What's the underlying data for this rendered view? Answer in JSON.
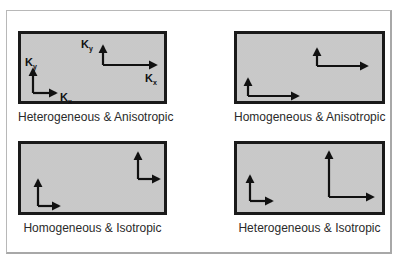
{
  "figure": {
    "panels": [
      {
        "id": "p1",
        "caption": "Heterogeneous & Anisotropic",
        "box": {
          "x": 18,
          "y": 31,
          "w": 149,
          "h": 73
        },
        "axes": [
          {
            "ox": 12,
            "oy": 59,
            "up": 22,
            "right": 22,
            "labels": {
              "ky": "K",
              "ky_sub": "y",
              "kx": "K",
              "kx_sub": "x"
            }
          },
          {
            "ox": 82,
            "oy": 31,
            "up": 17,
            "right": 52,
            "labels": {
              "ky": "K",
              "ky_sub": "y",
              "kx": "K",
              "kx_sub": "x"
            }
          }
        ]
      },
      {
        "id": "p2",
        "caption": "Homogeneous & Anisotropic",
        "box": {
          "x": 234,
          "y": 31,
          "w": 151,
          "h": 73
        },
        "axes": [
          {
            "ox": 11,
            "oy": 62,
            "up": 17,
            "right": 51
          },
          {
            "ox": 80,
            "oy": 32,
            "up": 17,
            "right": 51
          }
        ]
      },
      {
        "id": "p3",
        "caption": "Homogeneous & Isotropic",
        "box": {
          "x": 18,
          "y": 141,
          "w": 149,
          "h": 74
        },
        "axes": [
          {
            "ox": 17,
            "oy": 62,
            "up": 26,
            "right": 21
          },
          {
            "ox": 117,
            "oy": 35,
            "up": 26,
            "right": 21
          }
        ]
      },
      {
        "id": "p4",
        "caption": "Heterogeneous & Isotropic",
        "box": {
          "x": 234,
          "y": 141,
          "w": 151,
          "h": 74
        },
        "axes": [
          {
            "ox": 13,
            "oy": 57,
            "up": 25,
            "right": 22
          },
          {
            "ox": 92,
            "oy": 53,
            "up": 45,
            "right": 44
          }
        ]
      }
    ],
    "colors": {
      "border": "#1a1a1a",
      "fill": "#d9d9d9",
      "arrow": "#111111",
      "caption": "#2a2a2a"
    }
  }
}
